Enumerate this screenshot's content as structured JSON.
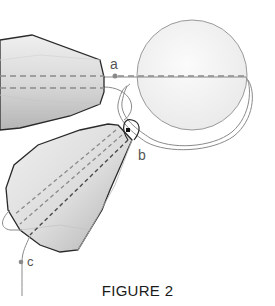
{
  "figure": {
    "caption": "FIGURE 2",
    "labels": {
      "a": "a",
      "b": "b",
      "c": "c"
    },
    "colors": {
      "outline": "#2a2a2a",
      "dash": "#8a8a8a",
      "bead_fill_light": "#e6e6e6",
      "bead_fill_dark": "#bdbdbd",
      "pearl_fill": "#f3f3f3",
      "pearl_outline": "#9a9a9a",
      "thread": "#7a7a7a"
    },
    "elements": [
      {
        "type": "faceted-bead",
        "name": "top-left-bead"
      },
      {
        "type": "round-bead",
        "name": "pearl"
      },
      {
        "type": "faceted-bead",
        "name": "lower-bead"
      },
      {
        "type": "thread-path",
        "name": "thread"
      },
      {
        "type": "point",
        "name": "a"
      },
      {
        "type": "point",
        "name": "b"
      },
      {
        "type": "point",
        "name": "c"
      }
    ]
  }
}
